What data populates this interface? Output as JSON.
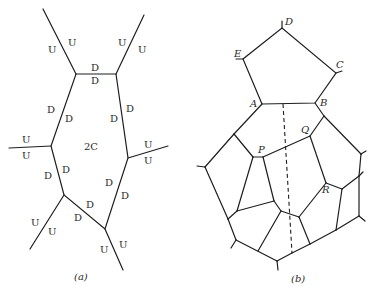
{
  "figure": {
    "panel_a": {
      "caption": "(a)",
      "center_label": "2C",
      "up_label": "U",
      "down_label": "D",
      "edge_labels": [
        {
          "text": "U",
          "x": 48,
          "y": 53
        },
        {
          "text": "U",
          "x": 68,
          "y": 46
        },
        {
          "text": "U",
          "x": 118,
          "y": 46
        },
        {
          "text": "U",
          "x": 138,
          "y": 53
        },
        {
          "text": "D",
          "x": 94,
          "y": 71
        },
        {
          "text": "D",
          "x": 94,
          "y": 84
        },
        {
          "text": "D",
          "x": 49,
          "y": 113
        },
        {
          "text": "D",
          "x": 66,
          "y": 122
        },
        {
          "text": "D",
          "x": 129,
          "y": 112
        },
        {
          "text": "D",
          "x": 112,
          "y": 122
        },
        {
          "text": "U",
          "x": 24,
          "y": 143
        },
        {
          "text": "U",
          "x": 24,
          "y": 160
        },
        {
          "text": "U",
          "x": 145,
          "y": 148
        },
        {
          "text": "U",
          "x": 145,
          "y": 164
        },
        {
          "text": "D",
          "x": 46,
          "y": 179
        },
        {
          "text": "D",
          "x": 63,
          "y": 173
        },
        {
          "text": "D",
          "x": 106,
          "y": 186
        },
        {
          "text": "D",
          "x": 121,
          "y": 199
        },
        {
          "text": "D",
          "x": 87,
          "y": 209
        },
        {
          "text": "D",
          "x": 74,
          "y": 221
        },
        {
          "text": "U",
          "x": 32,
          "y": 226
        },
        {
          "text": "U",
          "x": 49,
          "y": 235
        },
        {
          "text": "U",
          "x": 101,
          "y": 253
        },
        {
          "text": "U",
          "x": 120,
          "y": 248
        }
      ]
    },
    "panel_b": {
      "caption": "(b)",
      "vertex_labels": [
        {
          "text": "D",
          "x": 285,
          "y": 25
        },
        {
          "text": "E",
          "x": 235,
          "y": 56
        },
        {
          "text": "C",
          "x": 336,
          "y": 67
        },
        {
          "text": "A",
          "x": 250,
          "y": 107
        },
        {
          "text": "B",
          "x": 321,
          "y": 106
        },
        {
          "text": "Q",
          "x": 300,
          "y": 133
        },
        {
          "text": "P",
          "x": 258,
          "y": 153
        },
        {
          "text": "R",
          "x": 322,
          "y": 193
        }
      ]
    }
  }
}
